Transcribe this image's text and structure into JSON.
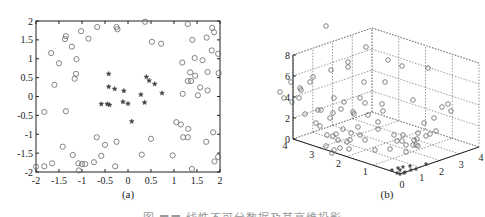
{
  "chart_data": [
    {
      "type": "scatter",
      "label": "(a)",
      "title": "",
      "xlabel": "",
      "ylabel": "",
      "xlim": [
        -2,
        2
      ],
      "ylim": [
        -2,
        2
      ],
      "xticks": [
        "-2",
        "-1.5",
        "-1",
        "-0.5",
        "0",
        "0.5",
        "1",
        "1.5",
        "2"
      ],
      "yticks": [
        "2",
        "1.5",
        "1",
        "0.5",
        "0",
        "-0.5",
        "-1",
        "-1.5",
        "-2"
      ],
      "grid": false,
      "series": [
        {
          "name": "outer (circle markers)",
          "marker": "o",
          "points": [
            [
              -1.67,
              1.15
            ],
            [
              -1.5,
              0.88
            ],
            [
              -1.6,
              0.31
            ],
            [
              -1.35,
              1.6
            ],
            [
              -1.37,
              1.52
            ],
            [
              -1.22,
              1.32
            ],
            [
              -1.02,
              1.73
            ],
            [
              -0.86,
              1.53
            ],
            [
              -1.12,
              0.99
            ],
            [
              -1.13,
              0.6
            ],
            [
              -1.16,
              0.47
            ],
            [
              -0.67,
              1.84
            ],
            [
              -0.25,
              1.84
            ],
            [
              -0.23,
              1.78
            ],
            [
              0.37,
              1.98
            ],
            [
              0.52,
              1.45
            ],
            [
              0.72,
              1.4
            ],
            [
              1.3,
              1.92
            ],
            [
              1.4,
              1.5
            ],
            [
              1.18,
              0.9
            ],
            [
              1.45,
              1.02
            ],
            [
              1.62,
              0.96
            ],
            [
              1.83,
              1.82
            ],
            [
              1.87,
              1.7
            ],
            [
              1.71,
              1.56
            ],
            [
              1.82,
              1.22
            ],
            [
              1.96,
              1.13
            ],
            [
              1.97,
              0.62
            ],
            [
              1.73,
              0.65
            ],
            [
              1.35,
              0.64
            ],
            [
              1.46,
              0.55
            ],
            [
              1.3,
              0.41
            ],
            [
              1.37,
              0.41
            ],
            [
              1.57,
              0.24
            ],
            [
              1.73,
              0.16
            ],
            [
              1.19,
              0.07
            ],
            [
              1.52,
              0.03
            ],
            [
              -1.82,
              -0.41
            ],
            [
              -1.35,
              -0.39
            ],
            [
              1.05,
              -0.68
            ],
            [
              1.15,
              -0.74
            ],
            [
              1.31,
              -0.86
            ],
            [
              1.2,
              -1.08
            ],
            [
              1.3,
              -1.08
            ],
            [
              1.85,
              -0.95
            ],
            [
              1.7,
              -1.2
            ],
            [
              0.97,
              -1.56
            ],
            [
              0.5,
              -1.12
            ],
            [
              0.3,
              -1.54
            ],
            [
              -0.68,
              -1.08
            ],
            [
              -0.5,
              -1.28
            ],
            [
              -0.25,
              -1.2
            ],
            [
              -1.42,
              -1.33
            ],
            [
              -1.2,
              -1.55
            ],
            [
              -0.58,
              -1.57
            ],
            [
              -1.65,
              -1.77
            ],
            [
              -1.82,
              -1.85
            ],
            [
              -2.0,
              -1.86
            ],
            [
              -1.08,
              -1.77
            ],
            [
              -1.0,
              -1.79
            ],
            [
              -0.93,
              -1.79
            ],
            [
              -0.74,
              -1.74
            ],
            [
              -0.28,
              -1.85
            ],
            [
              -1.07,
              -1.96
            ],
            [
              1.39,
              -1.92
            ],
            [
              1.88,
              -1.72
            ],
            [
              1.96,
              -1.6
            ]
          ]
        },
        {
          "name": "inner (star markers)",
          "marker": "*",
          "points": [
            [
              -0.42,
              0.6
            ],
            [
              -0.42,
              0.26
            ],
            [
              -0.29,
              0.2
            ],
            [
              -0.09,
              0.15
            ],
            [
              0.4,
              0.52
            ],
            [
              0.46,
              0.42
            ],
            [
              0.58,
              0.33
            ],
            [
              0.74,
              0.09
            ],
            [
              0.28,
              0.05
            ],
            [
              -0.58,
              -0.2
            ],
            [
              -0.45,
              -0.2
            ],
            [
              -0.4,
              -0.22
            ],
            [
              -0.11,
              -0.14
            ],
            [
              0.0,
              -0.19
            ],
            [
              0.36,
              -0.16
            ],
            [
              0.08,
              -0.66
            ]
          ]
        }
      ]
    },
    {
      "type": "scatter3d",
      "label": "(b)",
      "title": "",
      "xlim": [
        0,
        4
      ],
      "ylim": [
        0,
        4
      ],
      "zlim": [
        0,
        8
      ],
      "xticks": [
        "0",
        "1",
        "2",
        "3",
        "4"
      ],
      "yticks": [
        "0",
        "1",
        "2",
        "3",
        "4"
      ],
      "zticks": [
        "0",
        "2",
        "4",
        "6",
        "8"
      ],
      "grid": true,
      "grid_style": "dotted",
      "series": [
        {
          "name": "outer (circle markers, projected high)",
          "marker": "o",
          "description": "Points spread across x,y in [0,4] with z in roughly [0.5,7.5]"
        },
        {
          "name": "inner (star markers, projected near origin)",
          "marker": "*",
          "description": "Points clustered near x,y,z ≈ 0 to 0.5"
        }
      ]
    }
  ],
  "panels": {
    "a": {
      "label": "(a)"
    },
    "b": {
      "label": "(b)"
    }
  },
  "caption": "图 ■■ 线性不可分数据及其高维投影"
}
